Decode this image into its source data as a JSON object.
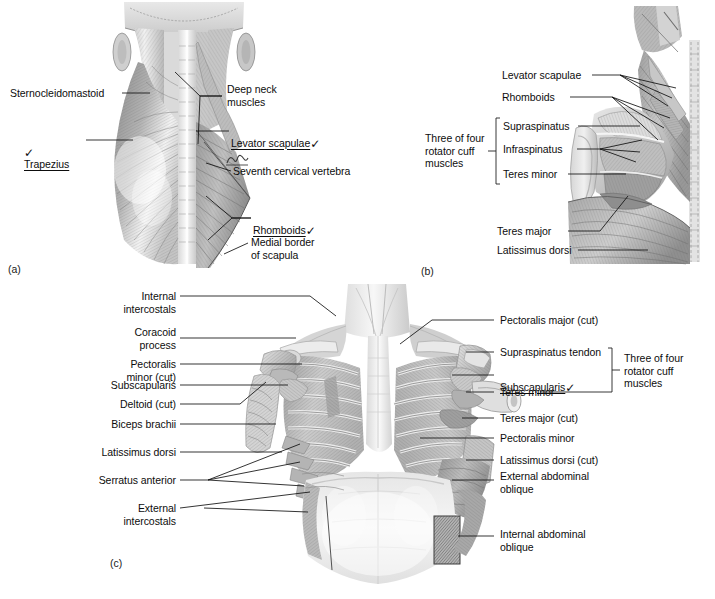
{
  "figure": {
    "background_color": "#ffffff",
    "ink_color": "#111111"
  },
  "panels": [
    {
      "tag": "(a)",
      "name": "panel-a",
      "description": "Superficial and deep muscles of the posterior neck and upper back"
    },
    {
      "tag": "(b)",
      "name": "panel-b",
      "description": "Posterior view of the scapula region showing rotator cuff muscles"
    },
    {
      "tag": "(c)",
      "name": "panel-c",
      "description": "Anterior view of the thorax with pectoralis major cut away"
    }
  ],
  "panel_a": {
    "tag": "(a)",
    "labels": [
      {
        "text": "Sternocleidomastoid",
        "marked": false,
        "underlined": false,
        "check": false
      },
      {
        "text": "Trapezius",
        "marked": true,
        "underlined": true,
        "check": true,
        "check_side": "left"
      },
      {
        "text": "Deep neck\nmuscles",
        "marked": false,
        "underlined": false,
        "check": false
      },
      {
        "text": "Levator scapulae",
        "marked": true,
        "underlined": true,
        "check": true,
        "check_side": "right"
      },
      {
        "text": "Seventh cervical vertebra",
        "marked": false,
        "underlined": false,
        "check": false,
        "annotation": "handwritten-scribble"
      },
      {
        "text": "Rhomboids",
        "marked": true,
        "underlined": true,
        "check": true,
        "check_side": "right"
      },
      {
        "text": "Medial border\nof scapula",
        "marked": false,
        "underlined": false,
        "check": false
      }
    ]
  },
  "panel_b": {
    "tag": "(b)",
    "labels": [
      {
        "text": "Levator scapulae"
      },
      {
        "text": "Rhomboids"
      },
      {
        "text": "Supraspinatus"
      },
      {
        "text": "Infraspinatus"
      },
      {
        "text": "Teres minor"
      },
      {
        "text": "Teres major"
      },
      {
        "text": "Latissimus dorsi"
      }
    ],
    "bracket_label": "Three of four\nrotator cuff\nmuscles",
    "bracket_members": [
      "Supraspinatus",
      "Infraspinatus",
      "Teres minor"
    ]
  },
  "panel_c": {
    "tag": "(c)",
    "left_labels": [
      {
        "text": "Internal\nintercostals"
      },
      {
        "text": "Coracoid\nprocess"
      },
      {
        "text": "Pectoralis\nminor (cut)"
      },
      {
        "text": "Subscapularis"
      },
      {
        "text": "Deltoid (cut)"
      },
      {
        "text": "Biceps brachii"
      },
      {
        "text": "Latissimus dorsi"
      },
      {
        "text": "Serratus anterior"
      },
      {
        "text": "External\nintercostals"
      }
    ],
    "right_labels": [
      {
        "text": "Pectoralis major (cut)",
        "underlined": false,
        "check": false
      },
      {
        "text": "Supraspinatus tendon",
        "underlined": false,
        "check": false
      },
      {
        "text": "Subscapularis",
        "underlined": true,
        "check": true
      },
      {
        "text": "Teres minor",
        "underlined": false,
        "check": false
      },
      {
        "text": "Teres major (cut)",
        "underlined": false,
        "check": false
      },
      {
        "text": "Pectoralis minor",
        "underlined": false,
        "check": false
      },
      {
        "text": "Latissimus dorsi (cut)",
        "underlined": false,
        "check": false
      },
      {
        "text": "External abdominal\noblique",
        "underlined": false,
        "check": false
      },
      {
        "text": "Internal abdominal\noblique",
        "underlined": false,
        "check": false
      }
    ],
    "bracket_label": "Three of four\nrotator cuff\nmuscles",
    "bracket_members": [
      "Supraspinatus tendon",
      "Subscapularis",
      "Teres minor"
    ]
  },
  "icons": {
    "check": "✓"
  }
}
